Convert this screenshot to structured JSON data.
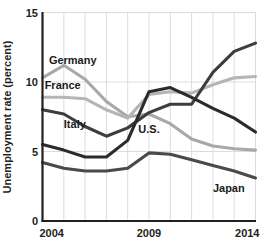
{
  "chart_data": {
    "type": "line",
    "title": "",
    "xlabel": "",
    "ylabel": "Unemployment rate (percent)",
    "xlim": [
      2004,
      2014
    ],
    "ylim": [
      0,
      15
    ],
    "yticks": [
      0,
      5,
      10,
      15
    ],
    "ytick_labels": [
      "0",
      "5",
      "10",
      "15"
    ],
    "xticks": [
      2004,
      2009,
      2014
    ],
    "xtick_labels": [
      "2004",
      "2009",
      "2014"
    ],
    "grid": "vertical-and-horizontal-light",
    "legend": "inline-series-labels",
    "x": [
      2004,
      2005,
      2006,
      2007,
      2008,
      2009,
      2010,
      2011,
      2012,
      2013,
      2014
    ],
    "series": [
      {
        "name": "Germany",
        "color": "#a8a8a8",
        "label_x": 2004.3,
        "label_y": 11.6,
        "values": [
          10.3,
          11.2,
          10.2,
          8.6,
          7.5,
          7.7,
          7.0,
          5.9,
          5.4,
          5.2,
          5.1
        ]
      },
      {
        "name": "France",
        "color": "#b5b5b5",
        "label_x": 2004.1,
        "label_y": 9.8,
        "values": [
          8.9,
          8.9,
          8.8,
          8.0,
          7.4,
          9.1,
          9.3,
          9.2,
          9.8,
          10.3,
          10.4
        ]
      },
      {
        "name": "Italy",
        "color": "#3d3d3d",
        "label_x": 2005.0,
        "label_y": 7.0,
        "values": [
          8.0,
          7.7,
          6.8,
          6.1,
          6.7,
          7.8,
          8.4,
          8.4,
          10.7,
          12.2,
          12.8
        ]
      },
      {
        "name": "U.S.",
        "color": "#2b2b2b",
        "label_x": 2008.5,
        "label_y": 6.6,
        "values": [
          5.5,
          5.1,
          4.6,
          4.6,
          5.8,
          9.3,
          9.6,
          8.9,
          8.1,
          7.4,
          6.4
        ]
      },
      {
        "name": "Japan",
        "color": "#4a4a4a",
        "label_x": 2012.0,
        "label_y": 2.4,
        "values": [
          4.2,
          3.8,
          3.6,
          3.6,
          3.8,
          4.9,
          4.8,
          4.4,
          4.0,
          3.6,
          3.1
        ]
      }
    ]
  },
  "colors": {
    "axis": "#231f20",
    "grid": "#d9dde3",
    "background": "#ffffff",
    "text": "#231f20"
  }
}
